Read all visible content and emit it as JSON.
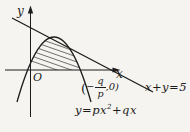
{
  "figure": {
    "colors": {
      "background": "#f5f4f0",
      "ink": "#1c1c1c",
      "hatch": "#4d4d4d"
    },
    "labels": {
      "y_axis": "y",
      "x_axis": "x",
      "origin": "O",
      "line": "x+y=5"
    },
    "equation": {
      "lhs": "y=px",
      "exponent": "2",
      "rhs": "+qx"
    },
    "point": {
      "open_paren": "(",
      "minus": "−",
      "numerator": "q",
      "denominator": "p",
      "close": ",0)"
    }
  }
}
